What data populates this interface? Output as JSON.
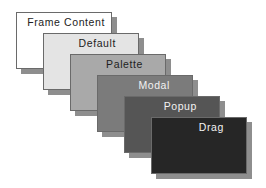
{
  "diagram": {
    "layers": [
      {
        "name": "Frame Content",
        "fill": "#ffffff",
        "text_color": "#222222"
      },
      {
        "name": "Default",
        "fill": "#e4e4e4",
        "text_color": "#222222"
      },
      {
        "name": "Palette",
        "fill": "#a9a9a9",
        "text_color": "#1e1e1e"
      },
      {
        "name": "Modal",
        "fill": "#7b7b7b",
        "text_color": "#f2f2f2"
      },
      {
        "name": "Popup",
        "fill": "#555555",
        "text_color": "#f2f2f2"
      },
      {
        "name": "Drag",
        "fill": "#262626",
        "text_color": "#f2f2f2"
      }
    ],
    "shadow_color": "#8e8e8e"
  }
}
